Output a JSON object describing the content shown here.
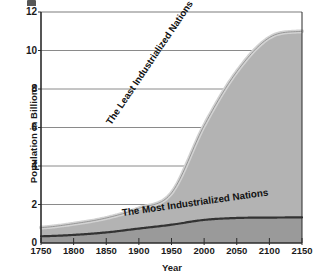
{
  "chart_data": {
    "type": "area",
    "title": "",
    "subtitle": "",
    "xlabel": "Year",
    "ylabel": "Population in Billions",
    "xlim": [
      1750,
      2150
    ],
    "ylim": [
      0,
      12
    ],
    "xticks": [
      1750,
      1800,
      1850,
      1900,
      1950,
      2000,
      2050,
      2100,
      2150
    ],
    "yticks": [
      0,
      2,
      4,
      6,
      8,
      10,
      12
    ],
    "grid": "horizontal",
    "legend": "inline-annotations",
    "stacked": true,
    "x": [
      1750,
      1800,
      1850,
      1900,
      1950,
      2000,
      2050,
      2100,
      2150
    ],
    "series": [
      {
        "name": "The Most Industrialized Nations",
        "values": [
          0.35,
          0.42,
          0.55,
          0.75,
          0.95,
          1.2,
          1.3,
          1.32,
          1.33
        ],
        "color": "#9a9a9a",
        "line_color": "#333333"
      },
      {
        "name": "The Least Industrialized Nations",
        "values": [
          0.45,
          0.58,
          0.75,
          1.05,
          1.65,
          4.9,
          7.6,
          9.35,
          9.67
        ],
        "color": "#b3b3b3",
        "line_color": "#cfcfcf"
      }
    ],
    "totals": [
      0.8,
      1.0,
      1.3,
      1.8,
      2.6,
      6.1,
      8.9,
      10.67,
      11.0
    ],
    "annotations": [
      {
        "text": "The Least Industrialized Nations",
        "orientation": "diagonal"
      },
      {
        "text": "The Most Industrialized Nations",
        "orientation": "near-horizontal"
      }
    ],
    "colors": {
      "upper_band": "#b3b3b3",
      "upper_edge": "#d2d2d2",
      "lower_band": "#9a9a9a",
      "lower_line": "#333333",
      "gridline": "#7d7d7d",
      "axis": "#2b2b2b",
      "plot_background": "#ffffff"
    }
  },
  "axes": {
    "y_title": "Population in Billions",
    "x_title": "Year",
    "y_tick_labels": [
      "12",
      "10",
      "8",
      "6",
      "4",
      "2",
      "0"
    ],
    "x_tick_labels": [
      "1750",
      "1800",
      "1850",
      "1900",
      "1950",
      "2000",
      "2050",
      "2100",
      "2150"
    ]
  },
  "labels": {
    "least": "The Least Industrialized Nations",
    "most": "The Most Industrialized Nations"
  }
}
